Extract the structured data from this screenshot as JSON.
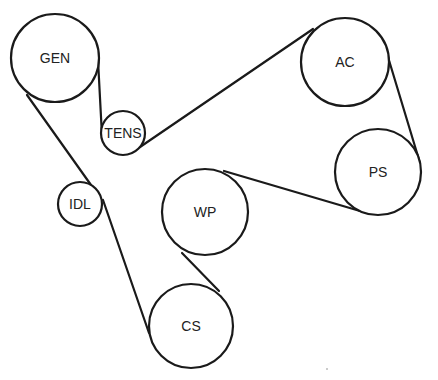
{
  "diagram": {
    "type": "serpentine-belt-routing",
    "stroke_color": "#1a1a1a",
    "background": "#ffffff",
    "pulleys": [
      {
        "id": "gen",
        "label": "GEN",
        "cx": 55,
        "cy": 58,
        "r": 44
      },
      {
        "id": "tens",
        "label": "TENS",
        "cx": 123,
        "cy": 133,
        "r": 22
      },
      {
        "id": "ac",
        "label": "AC",
        "cx": 345,
        "cy": 62,
        "r": 44
      },
      {
        "id": "ps",
        "label": "PS",
        "cx": 378,
        "cy": 172,
        "r": 43
      },
      {
        "id": "wp",
        "label": "WP",
        "cx": 205,
        "cy": 212,
        "r": 43
      },
      {
        "id": "cs",
        "label": "CS",
        "cx": 191,
        "cy": 326,
        "r": 42
      },
      {
        "id": "idl",
        "label": "IDL",
        "cx": 80,
        "cy": 204,
        "r": 22
      }
    ],
    "belt_segments": [
      {
        "from": "GEN",
        "to": "TENS",
        "x1": 98,
        "y1": 60,
        "x2": 102,
        "y2": 136
      },
      {
        "from": "TENS",
        "to": "AC",
        "x1": 140,
        "y1": 147,
        "x2": 313,
        "y2": 29
      },
      {
        "from": "AC",
        "to": "PS",
        "x1": 388,
        "y1": 57,
        "x2": 420,
        "y2": 163
      },
      {
        "from": "PS",
        "to": "WP",
        "x1": 360,
        "y1": 211,
        "x2": 224,
        "y2": 171
      },
      {
        "from": "WP",
        "to": "CS",
        "x1": 182,
        "y1": 253,
        "x2": 219,
        "y2": 291
      },
      {
        "from": "CS",
        "to": "IDL",
        "x1": 149,
        "y1": 333,
        "x2": 103,
        "y2": 200
      },
      {
        "from": "IDL",
        "to": "GEN",
        "x1": 91,
        "y1": 185,
        "x2": 27,
        "y2": 95
      }
    ]
  }
}
